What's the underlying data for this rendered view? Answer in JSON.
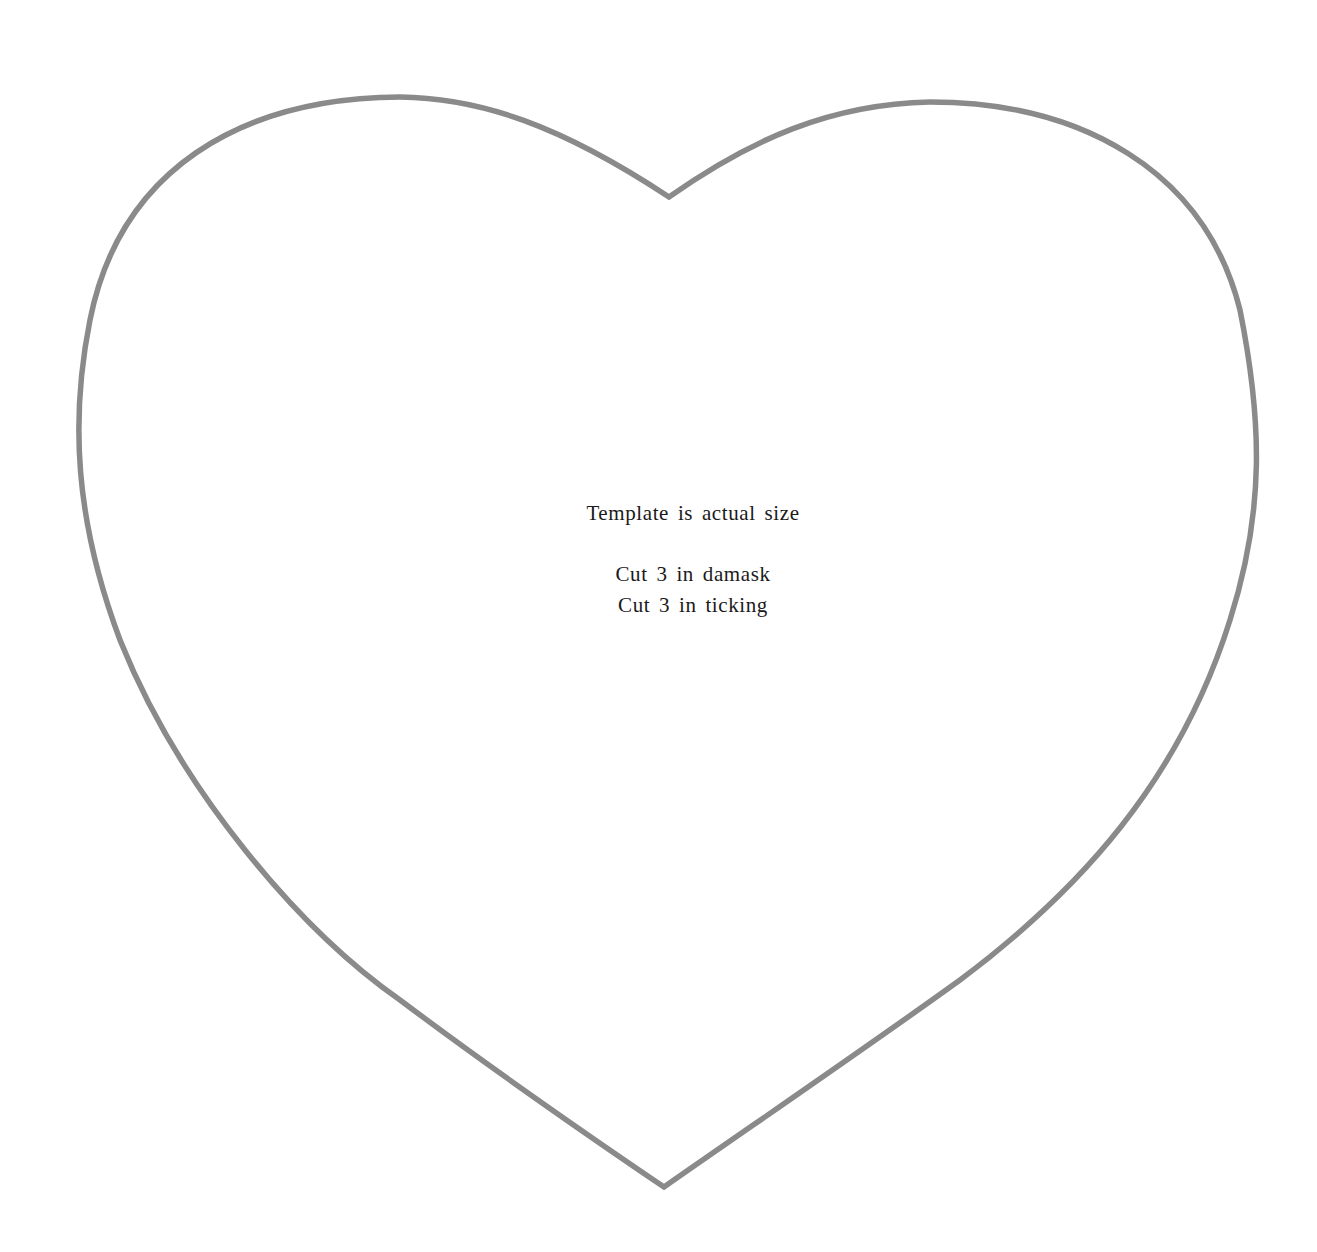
{
  "template": {
    "shape": "heart",
    "outline_color": "#8a8a8a",
    "background_color": "#ffffff",
    "text_color": "#1a1a1a",
    "lines": [
      "Template is actual size",
      "Cut 3 in damask",
      "Cut 3 in ticking"
    ]
  }
}
